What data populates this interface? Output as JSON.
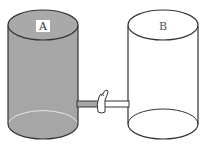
{
  "diagram": {
    "containers": [
      {
        "id": "A",
        "label": "A",
        "filled": true,
        "fill_color": "#a6a6a6"
      },
      {
        "id": "B",
        "label": "B",
        "filled": false,
        "fill_color": "#ffffff"
      }
    ],
    "connector": {
      "type": "pipe",
      "has_valve": true
    },
    "colors": {
      "outline": "#333333",
      "liquid": "#a6a6a6",
      "highlight": "#e8e8e8"
    }
  }
}
